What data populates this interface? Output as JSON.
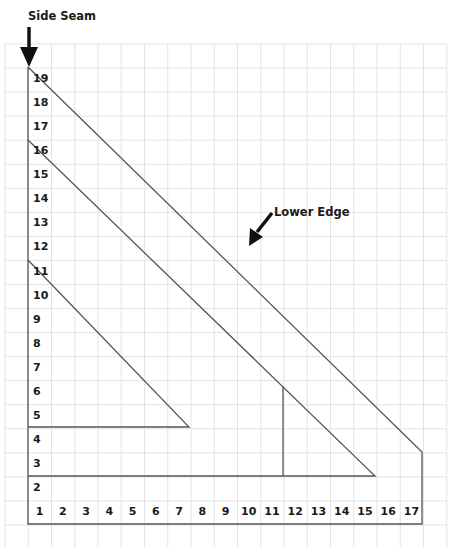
{
  "annotations": {
    "side_seam": "Side Seam",
    "lower_edge": "Lower Edge"
  },
  "row_labels": [
    "1",
    "2",
    "3",
    "4",
    "5",
    "6",
    "7",
    "8",
    "9",
    "10",
    "11",
    "12",
    "13",
    "14",
    "15",
    "16",
    "17",
    "18",
    "19"
  ],
  "column_labels": [
    "1",
    "2",
    "3",
    "4",
    "5",
    "6",
    "7",
    "8",
    "9",
    "10",
    "11",
    "12",
    "13",
    "14",
    "15",
    "16",
    "17"
  ],
  "colors": {
    "grid": "#e3e3e3",
    "outline": "#555555",
    "text": "#1a1a1a"
  }
}
